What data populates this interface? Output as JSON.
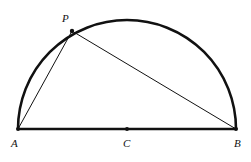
{
  "diagram": {
    "type": "semicircle with inscribed triangle",
    "points": {
      "A": {
        "label": "A",
        "x": 18,
        "y": 129
      },
      "B": {
        "label": "B",
        "x": 236,
        "y": 129
      },
      "C": {
        "label": "C",
        "x": 127,
        "y": 129
      },
      "P": {
        "label": "P",
        "x": 72,
        "y": 31
      }
    },
    "segments": [
      "AB",
      "AP",
      "PB"
    ],
    "arc": {
      "center": "C",
      "radius": 109,
      "from": "A",
      "to": "B"
    },
    "colors": {
      "stroke": "#111111",
      "background": "#ffffff"
    }
  }
}
